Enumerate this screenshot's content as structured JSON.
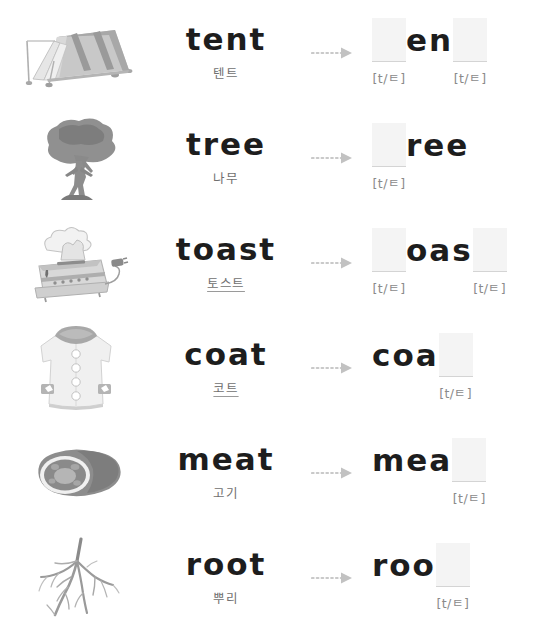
{
  "worksheet": {
    "phonetic_hint": "[t/ㅌ]",
    "arrow_icon": "dotted-arrow-right-icon",
    "colors": {
      "word_text": "#1d1d1d",
      "gloss_text": "#6f6f6f",
      "hint_text": "#8a8a8a",
      "blank_fill": "#f4f4f4",
      "blank_underline": "#d4d4d4",
      "arrow": "#c9c9c9",
      "background": "#ffffff"
    },
    "rows": [
      {
        "id": "tent",
        "illustration": "tent-illustration",
        "word": "tent",
        "gloss": "텐트",
        "gloss_underlined": false,
        "slots": [
          {
            "type": "gap",
            "text": "",
            "hint": "[t/ㅌ]"
          },
          {
            "type": "letters",
            "text": "en",
            "hint": ""
          },
          {
            "type": "gap",
            "text": "",
            "hint": "[t/ㅌ]"
          }
        ]
      },
      {
        "id": "tree",
        "illustration": "tree-illustration",
        "word": "tree",
        "gloss": "나무",
        "gloss_underlined": false,
        "slots": [
          {
            "type": "gap",
            "text": "",
            "hint": "[t/ㅌ]"
          },
          {
            "type": "letters",
            "text": "ree",
            "hint": ""
          }
        ]
      },
      {
        "id": "toast",
        "illustration": "toaster-illustration",
        "word": "toast",
        "gloss": "토스트",
        "gloss_underlined": true,
        "slots": [
          {
            "type": "gap",
            "text": "",
            "hint": "[t/ㅌ]"
          },
          {
            "type": "letters",
            "text": "oas",
            "hint": ""
          },
          {
            "type": "gap",
            "text": "",
            "hint": "[t/ㅌ]"
          }
        ]
      },
      {
        "id": "coat",
        "illustration": "coat-illustration",
        "word": "coat",
        "gloss": "코트",
        "gloss_underlined": true,
        "slots": [
          {
            "type": "letters",
            "text": "coa",
            "hint": ""
          },
          {
            "type": "gap",
            "text": "",
            "hint": "[t/ㅌ]"
          }
        ]
      },
      {
        "id": "meat",
        "illustration": "meat-illustration",
        "word": "meat",
        "gloss": "고기",
        "gloss_underlined": false,
        "slots": [
          {
            "type": "letters",
            "text": "mea",
            "hint": ""
          },
          {
            "type": "gap",
            "text": "",
            "hint": "[t/ㅌ]"
          }
        ]
      },
      {
        "id": "root",
        "illustration": "root-illustration",
        "word": "root",
        "gloss": "뿌리",
        "gloss_underlined": false,
        "slots": [
          {
            "type": "letters",
            "text": "roo",
            "hint": ""
          },
          {
            "type": "gap",
            "text": "",
            "hint": "[t/ㅌ]"
          }
        ]
      }
    ]
  }
}
